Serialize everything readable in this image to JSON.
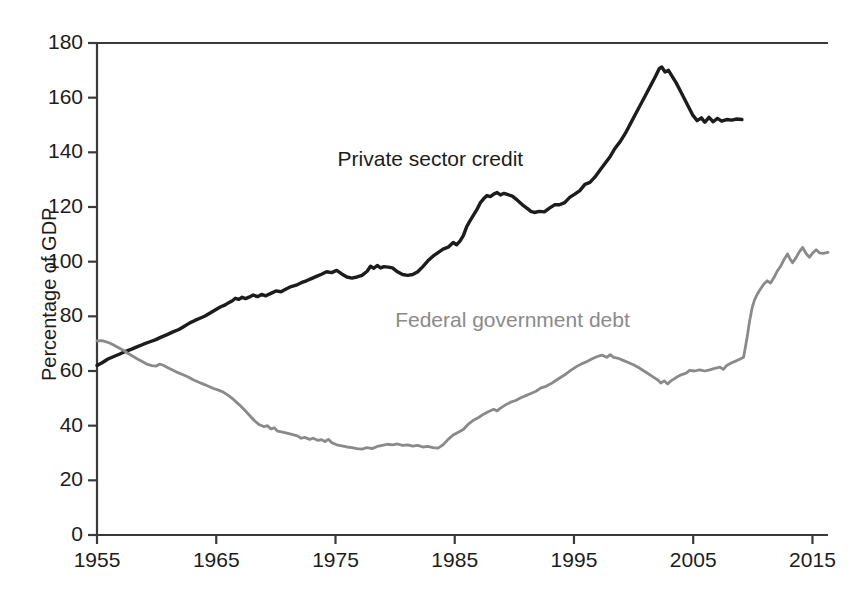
{
  "chart_data": {
    "type": "line",
    "title": "",
    "subtitle": "",
    "xlabel": "",
    "ylabel": "Percentage of GDP",
    "xlim": [
      1955,
      2016
    ],
    "ylim": [
      0,
      180
    ],
    "ytick_step": 20,
    "xtick_step": 10,
    "grid": false,
    "legend_position": "inline-annotation",
    "yticks": [
      "0",
      "20",
      "40",
      "60",
      "80",
      "100",
      "120",
      "140",
      "160",
      "180"
    ],
    "ytick_values": [
      0,
      20,
      40,
      60,
      80,
      100,
      120,
      140,
      160,
      180
    ],
    "xticks": [
      "1955",
      "1965",
      "1975",
      "1985",
      "1995",
      "2005",
      "2015"
    ],
    "xtick_values": [
      1955,
      1965,
      1975,
      1985,
      1995,
      2005,
      2015
    ],
    "annotations": [
      {
        "name": "private-sector-credit-label",
        "text": "Private sector credit",
        "x": 1986.5,
        "y": 137
      },
      {
        "name": "federal-government-debt-label",
        "text": "Federal government debt",
        "x": 1993.0,
        "y": 78
      }
    ],
    "colors": {
      "private_sector_credit": "#1c1c1c",
      "federal_government_debt": "#8a8a8a",
      "axis": "#3a3a3a",
      "background": "#ffffff"
    },
    "series": [
      {
        "name": "Private sector credit",
        "color": "#1c1c1c",
        "x": [
          1955,
          1956,
          1957,
          1958,
          1959,
          1960,
          1961,
          1962,
          1963,
          1964,
          1965,
          1966,
          1967,
          1968,
          1969,
          1970,
          1971,
          1972,
          1973,
          1974,
          1975,
          1976,
          1977,
          1978,
          1979,
          1980,
          1981,
          1982,
          1983,
          1984,
          1985,
          1986,
          1987,
          1988,
          1989,
          1990,
          1991,
          1992,
          1993,
          1994,
          1995,
          1996,
          1997,
          1998,
          1999,
          2000,
          2001,
          2002,
          2003,
          2004,
          2005,
          2006,
          2007,
          2008,
          2009,
          2010,
          2011,
          2012,
          2013,
          2014,
          2015,
          2016
        ],
        "values": [
          62,
          64,
          66,
          68,
          70,
          72,
          74,
          76,
          78,
          80,
          82,
          84,
          85,
          86,
          88,
          87,
          88,
          90,
          91,
          92,
          93,
          94,
          95,
          96,
          97,
          98,
          97,
          96,
          95,
          94,
          96,
          99,
          98,
          97,
          98,
          97,
          95,
          94,
          96,
          100,
          103,
          105,
          107,
          113,
          119,
          123,
          125,
          125,
          124,
          122,
          119,
          118,
          118,
          120,
          121,
          120,
          122,
          125,
          126,
          130,
          134,
          139
        ]
      },
      {
        "name": "Federal government debt",
        "color": "#8a8a8a",
        "x": [
          1955,
          1960,
          1965,
          1970,
          1975,
          1980,
          1985,
          1990,
          1995,
          2000,
          2005,
          2010,
          2015
        ],
        "values": [
          71,
          64,
          58,
          48,
          34,
          32,
          44,
          58,
          66,
          56,
          62,
          92,
          103
        ]
      }
    ],
    "private_sector_credit_path": [
      [
        1955.0,
        62
      ],
      [
        1955.6,
        63
      ],
      [
        1956.3,
        64.4
      ],
      [
        1957.0,
        65.3
      ],
      [
        1957.7,
        66.2
      ],
      [
        1958.4,
        67.2
      ],
      [
        1959.1,
        68.0
      ],
      [
        1959.8,
        68.9
      ],
      [
        1960.5,
        69.8
      ],
      [
        1961.2,
        70.6
      ],
      [
        1961.9,
        71.4
      ],
      [
        1962.6,
        72.4
      ],
      [
        1963.3,
        73.3
      ],
      [
        1964.0,
        74.3
      ],
      [
        1964.7,
        75.2
      ],
      [
        1965.3,
        76.3
      ],
      [
        1966.0,
        77.6
      ],
      [
        1966.6,
        78.5
      ],
      [
        1967.2,
        79.3
      ],
      [
        1967.8,
        80.1
      ],
      [
        1968.4,
        81.2
      ],
      [
        1969.0,
        82.3
      ],
      [
        1969.6,
        83.4
      ],
      [
        1970.2,
        84.2
      ],
      [
        1970.6,
        85.0
      ],
      [
        1971.0,
        85.6
      ],
      [
        1971.4,
        86.6
      ],
      [
        1971.8,
        86.2
      ],
      [
        1972.2,
        87.0
      ],
      [
        1972.6,
        86.5
      ],
      [
        1973.0,
        87.0
      ],
      [
        1973.5,
        87.8
      ],
      [
        1974.0,
        87.2
      ],
      [
        1974.5,
        88.0
      ],
      [
        1975.0,
        87.5
      ],
      [
        1975.6,
        88.4
      ],
      [
        1976.2,
        89.3
      ],
      [
        1976.8,
        89.0
      ],
      [
        1977.4,
        90.0
      ],
      [
        1978.0,
        90.9
      ],
      [
        1978.6,
        91.4
      ],
      [
        1979.2,
        92.3
      ],
      [
        1979.8,
        93.0
      ],
      [
        1980.4,
        93.8
      ],
      [
        1981.0,
        94.6
      ],
      [
        1981.6,
        95.4
      ],
      [
        1982.2,
        96.3
      ],
      [
        1982.8,
        96.0
      ],
      [
        1983.4,
        96.8
      ],
      [
        1984.0,
        95.5
      ],
      [
        1984.6,
        94.4
      ],
      [
        1985.2,
        94.0
      ],
      [
        1985.8,
        94.4
      ],
      [
        1986.4,
        95.0
      ],
      [
        1987.0,
        96.5
      ],
      [
        1987.4,
        98.3
      ],
      [
        1987.8,
        97.6
      ],
      [
        1988.2,
        98.6
      ],
      [
        1988.6,
        97.7
      ],
      [
        1989.0,
        98.2
      ],
      [
        1989.5,
        98.0
      ],
      [
        1990.0,
        97.7
      ],
      [
        1990.6,
        96.3
      ],
      [
        1991.2,
        95.3
      ],
      [
        1991.8,
        95.0
      ],
      [
        1992.4,
        95.3
      ],
      [
        1993.0,
        96.3
      ],
      [
        1993.6,
        98.2
      ],
      [
        1994.2,
        100.3
      ],
      [
        1994.8,
        102.0
      ],
      [
        1995.4,
        103.3
      ],
      [
        1996.0,
        104.6
      ],
      [
        1996.6,
        105.3
      ],
      [
        1997.2,
        107.0
      ],
      [
        1997.6,
        106.2
      ],
      [
        1998.0,
        107.5
      ],
      [
        1998.4,
        109.5
      ],
      [
        1998.8,
        112.8
      ],
      [
        1999.2,
        115.0
      ],
      [
        1999.6,
        117.0
      ],
      [
        2000.0,
        119.0
      ],
      [
        2000.4,
        121.5
      ],
      [
        2000.8,
        123.0
      ],
      [
        2001.2,
        124.2
      ],
      [
        2001.6,
        123.8
      ],
      [
        2002.0,
        124.7
      ],
      [
        2002.4,
        125.3
      ],
      [
        2002.8,
        124.4
      ],
      [
        2003.2,
        125.0
      ],
      [
        2003.6,
        124.6
      ],
      [
        2004.2,
        124.0
      ],
      [
        2004.8,
        122.5
      ],
      [
        2005.4,
        120.8
      ],
      [
        2006.0,
        119.4
      ],
      [
        2006.4,
        118.4
      ],
      [
        2006.8,
        118.0
      ],
      [
        2007.4,
        118.4
      ],
      [
        2008.0,
        118.2
      ],
      [
        2008.6,
        119.6
      ],
      [
        2009.2,
        120.8
      ],
      [
        2009.8,
        120.8
      ],
      [
        2010.4,
        121.6
      ],
      [
        2011.0,
        123.5
      ],
      [
        2011.6,
        124.7
      ],
      [
        2012.2,
        126.0
      ],
      [
        2012.8,
        128.3
      ],
      [
        2013.4,
        129.0
      ],
      [
        2014.0,
        131.0
      ],
      [
        2014.6,
        133.5
      ],
      [
        2015.2,
        136.0
      ],
      [
        2015.8,
        138.5
      ],
      [
        2016.4,
        141.6
      ],
      [
        2017.0,
        144.0
      ],
      [
        2017.6,
        147.0
      ],
      [
        2018.2,
        150.5
      ],
      [
        2018.8,
        154.0
      ],
      [
        2019.4,
        157.5
      ],
      [
        2020.0,
        161.0
      ],
      [
        2020.6,
        164.5
      ],
      [
        2021.2,
        168.0
      ],
      [
        2021.6,
        170.6
      ],
      [
        2021.9,
        171.2
      ],
      [
        2022.3,
        169.4
      ],
      [
        2022.7,
        170.0
      ],
      [
        2023.1,
        168.0
      ],
      [
        2023.6,
        165.5
      ],
      [
        2024.1,
        162.5
      ],
      [
        2024.6,
        159.5
      ],
      [
        2025.1,
        156.5
      ],
      [
        2025.6,
        153.5
      ],
      [
        2026.1,
        151.6
      ],
      [
        2026.6,
        152.6
      ],
      [
        2027.0,
        151.0
      ],
      [
        2027.5,
        152.8
      ],
      [
        2028.0,
        151.2
      ],
      [
        2028.5,
        152.4
      ],
      [
        2029.0,
        151.4
      ],
      [
        2029.6,
        152.0
      ],
      [
        2030.2,
        151.8
      ],
      [
        2030.8,
        152.2
      ],
      [
        2031.4,
        152.0
      ]
    ],
    "federal_government_debt_path": [
      [
        1955.0,
        71.0
      ],
      [
        1955.6,
        71.1
      ],
      [
        1956.2,
        70.6
      ],
      [
        1956.8,
        69.8
      ],
      [
        1957.4,
        68.8
      ],
      [
        1958.0,
        67.8
      ],
      [
        1958.6,
        66.6
      ],
      [
        1959.2,
        65.5
      ],
      [
        1959.8,
        64.4
      ],
      [
        1960.4,
        63.4
      ],
      [
        1961.0,
        62.4
      ],
      [
        1961.5,
        62.0
      ],
      [
        1962.0,
        61.8
      ],
      [
        1962.4,
        62.5
      ],
      [
        1962.8,
        62.2
      ],
      [
        1963.4,
        61.2
      ],
      [
        1964.0,
        60.3
      ],
      [
        1964.6,
        59.4
      ],
      [
        1965.2,
        58.6
      ],
      [
        1965.8,
        57.8
      ],
      [
        1966.4,
        56.8
      ],
      [
        1967.0,
        56.0
      ],
      [
        1967.6,
        55.2
      ],
      [
        1968.2,
        54.4
      ],
      [
        1968.8,
        53.6
      ],
      [
        1969.4,
        53.0
      ],
      [
        1970.0,
        52.2
      ],
      [
        1970.6,
        51.0
      ],
      [
        1971.2,
        49.5
      ],
      [
        1971.8,
        47.8
      ],
      [
        1972.4,
        46.0
      ],
      [
        1973.0,
        44.0
      ],
      [
        1973.6,
        42.0
      ],
      [
        1974.2,
        40.4
      ],
      [
        1974.8,
        39.6
      ],
      [
        1975.2,
        40.0
      ],
      [
        1975.6,
        38.8
      ],
      [
        1976.0,
        39.2
      ],
      [
        1976.4,
        38.0
      ],
      [
        1977.0,
        37.6
      ],
      [
        1977.6,
        37.2
      ],
      [
        1978.2,
        36.7
      ],
      [
        1978.8,
        36.2
      ],
      [
        1979.2,
        35.4
      ],
      [
        1979.6,
        35.7
      ],
      [
        1980.2,
        35.0
      ],
      [
        1980.6,
        35.4
      ],
      [
        1981.2,
        34.6
      ],
      [
        1981.6,
        34.9
      ],
      [
        1982.0,
        34.2
      ],
      [
        1982.4,
        35.0
      ],
      [
        1982.8,
        33.8
      ],
      [
        1983.4,
        33.0
      ],
      [
        1984.0,
        32.6
      ],
      [
        1984.6,
        32.2
      ],
      [
        1985.2,
        32.0
      ],
      [
        1985.8,
        31.6
      ],
      [
        1986.4,
        31.4
      ],
      [
        1987.0,
        32.0
      ],
      [
        1987.6,
        31.6
      ],
      [
        1988.2,
        32.4
      ],
      [
        1988.8,
        32.8
      ],
      [
        1989.4,
        33.2
      ],
      [
        1990.0,
        33.0
      ],
      [
        1990.6,
        33.3
      ],
      [
        1991.2,
        32.8
      ],
      [
        1991.8,
        33.0
      ],
      [
        1992.4,
        32.5
      ],
      [
        1993.0,
        32.8
      ],
      [
        1993.6,
        32.2
      ],
      [
        1994.2,
        32.4
      ],
      [
        1994.8,
        32.0
      ],
      [
        1995.4,
        31.8
      ],
      [
        1996.0,
        33.0
      ],
      [
        1996.6,
        35.0
      ],
      [
        1997.2,
        36.6
      ],
      [
        1997.8,
        37.6
      ],
      [
        1998.4,
        38.6
      ],
      [
        1999.0,
        40.6
      ],
      [
        1999.6,
        42.0
      ],
      [
        2000.2,
        43.0
      ],
      [
        2000.8,
        44.2
      ],
      [
        2001.4,
        45.2
      ],
      [
        2002.0,
        46.0
      ],
      [
        2002.4,
        45.4
      ],
      [
        2002.8,
        46.4
      ],
      [
        2003.4,
        47.6
      ],
      [
        2004.0,
        48.6
      ],
      [
        2004.6,
        49.2
      ],
      [
        2005.2,
        50.2
      ],
      [
        2005.8,
        51.0
      ],
      [
        2006.4,
        51.8
      ],
      [
        2007.0,
        52.6
      ],
      [
        2007.6,
        53.8
      ],
      [
        2008.2,
        54.4
      ],
      [
        2008.8,
        55.4
      ],
      [
        2009.4,
        56.6
      ],
      [
        2010.0,
        57.8
      ],
      [
        2010.6,
        59.0
      ],
      [
        2011.2,
        60.4
      ],
      [
        2011.8,
        61.6
      ],
      [
        2012.4,
        62.6
      ],
      [
        2013.0,
        63.4
      ],
      [
        2013.6,
        64.4
      ],
      [
        2014.2,
        65.2
      ],
      [
        2014.8,
        65.8
      ],
      [
        2015.4,
        65.0
      ],
      [
        2015.8,
        66.0
      ],
      [
        2016.2,
        65.0
      ],
      [
        2016.8,
        64.6
      ],
      [
        2017.4,
        63.8
      ],
      [
        2018.0,
        63.0
      ],
      [
        2018.6,
        62.2
      ],
      [
        2019.2,
        61.2
      ],
      [
        2019.8,
        60.0
      ],
      [
        2020.4,
        58.8
      ],
      [
        2021.0,
        57.6
      ],
      [
        2021.4,
        56.8
      ],
      [
        2021.8,
        55.6
      ],
      [
        2022.2,
        56.4
      ],
      [
        2022.6,
        55.2
      ],
      [
        2023.0,
        56.4
      ],
      [
        2023.6,
        57.6
      ],
      [
        2024.2,
        58.6
      ],
      [
        2024.8,
        59.2
      ],
      [
        2025.2,
        60.2
      ],
      [
        2025.8,
        60.0
      ],
      [
        2026.4,
        60.4
      ],
      [
        2027.0,
        60.0
      ],
      [
        2027.6,
        60.4
      ],
      [
        2028.2,
        61.0
      ],
      [
        2028.8,
        61.4
      ],
      [
        2029.2,
        60.6
      ],
      [
        2029.6,
        62.0
      ],
      [
        2030.2,
        63.0
      ],
      [
        2030.8,
        63.8
      ],
      [
        2031.2,
        64.4
      ],
      [
        2031.6,
        65.0
      ],
      [
        2032.0,
        72.0
      ],
      [
        2032.3,
        78.0
      ],
      [
        2032.6,
        83.0
      ],
      [
        2032.9,
        86.0
      ],
      [
        2033.2,
        88.0
      ],
      [
        2033.6,
        90.0
      ],
      [
        2034.0,
        91.8
      ],
      [
        2034.4,
        93.0
      ],
      [
        2034.8,
        92.2
      ],
      [
        2035.2,
        94.2
      ],
      [
        2035.6,
        96.6
      ],
      [
        2036.0,
        98.4
      ],
      [
        2036.4,
        100.8
      ],
      [
        2036.8,
        102.8
      ],
      [
        2037.1,
        101.0
      ],
      [
        2037.4,
        99.6
      ],
      [
        2037.8,
        101.4
      ],
      [
        2038.2,
        103.6
      ],
      [
        2038.6,
        105.2
      ],
      [
        2039.0,
        103.0
      ],
      [
        2039.4,
        101.6
      ],
      [
        2039.8,
        103.2
      ],
      [
        2040.2,
        104.4
      ],
      [
        2040.6,
        103.2
      ],
      [
        2041.0,
        103.0
      ],
      [
        2041.6,
        103.4
      ]
    ]
  }
}
